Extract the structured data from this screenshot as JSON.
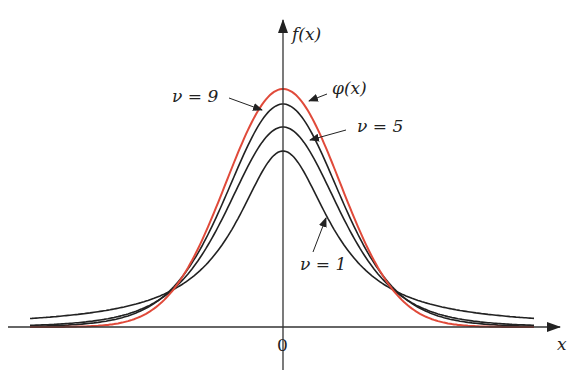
{
  "chart_data": {
    "type": "line",
    "title": "",
    "xlabel": "x",
    "ylabel": "f(x)",
    "x_tick_labels": [
      "0"
    ],
    "grid": false,
    "legend": "annotations with arrows",
    "x_range_pixels": [
      30,
      535
    ],
    "series": [
      {
        "name": "ν = 1",
        "color": "#222222",
        "peak_px": 151,
        "tail_px": 313,
        "df": 1
      },
      {
        "name": "ν = 5",
        "color": "#222222",
        "peak_px": 127,
        "tail_px": 318,
        "df": 5
      },
      {
        "name": "ν = 9",
        "color": "#222222",
        "peak_px": 104,
        "tail_px": 322,
        "df": 9
      },
      {
        "name": "φ(x)",
        "color": "#e04a3a",
        "peak_px": 89,
        "tail_px": 326,
        "df": "normal"
      }
    ],
    "annotations": [
      {
        "text": "ν = 9",
        "x": 172,
        "y": 102
      },
      {
        "text": "φ(x)",
        "x": 330,
        "y": 94
      },
      {
        "text": "ν = 5",
        "x": 355,
        "y": 132
      },
      {
        "text": "ν = 1",
        "x": 305,
        "y": 271
      }
    ]
  },
  "labels": {
    "y_axis": "f(x)",
    "x_axis": "x",
    "origin": "0",
    "nu9": "ν = 9",
    "phi": "φ(x)",
    "nu5": "ν = 5",
    "nu1": "ν = 1"
  },
  "colors": {
    "normal": "#e04a3a",
    "t": "#222222",
    "axis": "#333333"
  }
}
